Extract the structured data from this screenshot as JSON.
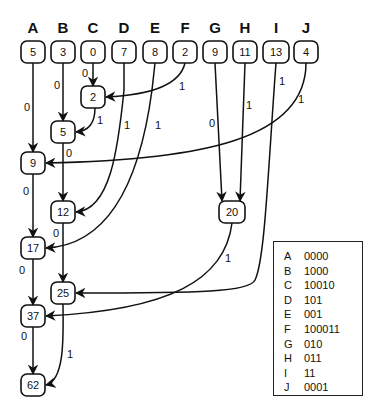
{
  "diagram": {
    "columns": [
      {
        "id": "A",
        "label": "A",
        "value": "5",
        "x": 33
      },
      {
        "id": "B",
        "label": "B",
        "value": "3",
        "x": 63
      },
      {
        "id": "C",
        "label": "C",
        "value": "0",
        "x": 93
      },
      {
        "id": "D",
        "label": "D",
        "value": "7",
        "x": 124
      },
      {
        "id": "E",
        "label": "E",
        "value": "8",
        "x": 155
      },
      {
        "id": "F",
        "label": "F",
        "value": "2",
        "x": 185
      },
      {
        "id": "G",
        "label": "G",
        "value": "9",
        "x": 215
      },
      {
        "id": "H",
        "label": "H",
        "value": "11",
        "x": 245
      },
      {
        "id": "I",
        "label": "I",
        "value": "13",
        "x": 276
      },
      {
        "id": "J",
        "label": "J",
        "value": "4",
        "x": 306
      }
    ],
    "internal_nodes": [
      {
        "id": "n2",
        "value": "2",
        "x": 93,
        "y": 97
      },
      {
        "id": "n5",
        "value": "5",
        "x": 63,
        "y": 132
      },
      {
        "id": "n9",
        "value": "9",
        "x": 33,
        "y": 163
      },
      {
        "id": "n12",
        "value": "12",
        "x": 63,
        "y": 212
      },
      {
        "id": "n20",
        "value": "20",
        "x": 232,
        "y": 212
      },
      {
        "id": "n17",
        "value": "17",
        "x": 33,
        "y": 248
      },
      {
        "id": "n25",
        "value": "25",
        "x": 63,
        "y": 293
      },
      {
        "id": "n37",
        "value": "37",
        "x": 33,
        "y": 316
      },
      {
        "id": "n62",
        "value": "62",
        "x": 33,
        "y": 385
      }
    ],
    "edges": [
      {
        "from": "C",
        "to": "n2",
        "label": "0"
      },
      {
        "from": "F",
        "to": "n2",
        "label": "1"
      },
      {
        "from": "B",
        "to": "n5",
        "label": "0"
      },
      {
        "from": "n2",
        "to": "n5",
        "label": "1"
      },
      {
        "from": "A",
        "to": "n9",
        "label": "0"
      },
      {
        "from": "J",
        "to": "n9",
        "label": "1"
      },
      {
        "from": "n5",
        "to": "n12",
        "label": "0"
      },
      {
        "from": "D",
        "to": "n12",
        "label": "1"
      },
      {
        "from": "G",
        "to": "n20",
        "label": "0"
      },
      {
        "from": "H",
        "to": "n20",
        "label": "1"
      },
      {
        "from": "n9",
        "to": "n17",
        "label": "0"
      },
      {
        "from": "E",
        "to": "n17",
        "label": "1"
      },
      {
        "from": "n12",
        "to": "n25",
        "label": "0"
      },
      {
        "from": "I",
        "to": "n25",
        "label": "1"
      },
      {
        "from": "n17",
        "to": "n37",
        "label": "0"
      },
      {
        "from": "n20",
        "to": "n37",
        "label": "1"
      },
      {
        "from": "n37",
        "to": "n62",
        "label": "0"
      },
      {
        "from": "n25",
        "to": "n62",
        "label": "1"
      }
    ]
  },
  "legend": {
    "rows": [
      {
        "symbol": "A",
        "code": "0000"
      },
      {
        "symbol": "B",
        "code": "1000"
      },
      {
        "symbol": "C",
        "code": "10010"
      },
      {
        "symbol": "D",
        "code": "101"
      },
      {
        "symbol": "E",
        "code": "001"
      },
      {
        "symbol": "F",
        "code": "100011"
      },
      {
        "symbol": "G",
        "code": "010"
      },
      {
        "symbol": "H",
        "code": "011"
      },
      {
        "symbol": "I",
        "code": "11"
      },
      {
        "symbol": "J",
        "code": "0001"
      }
    ]
  }
}
